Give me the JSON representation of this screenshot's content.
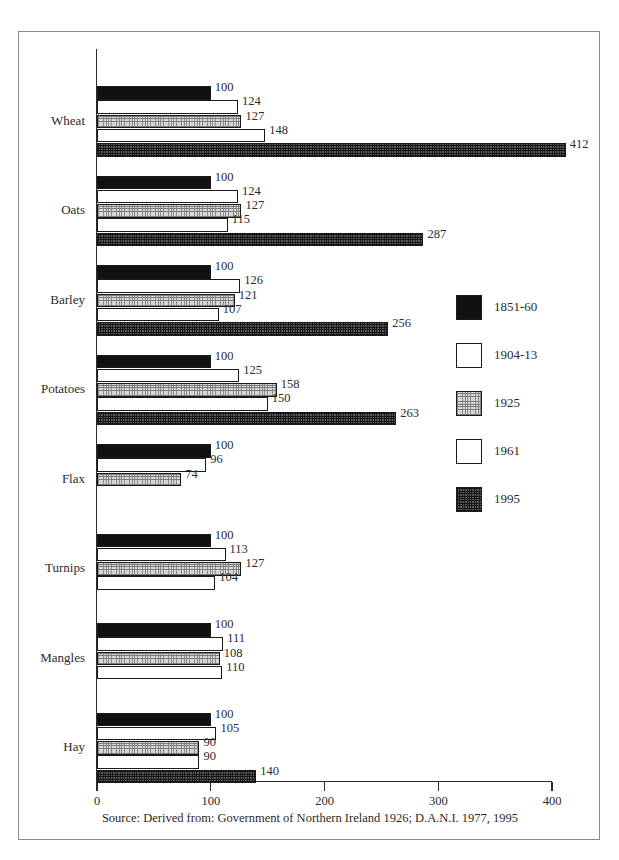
{
  "chart_data": {
    "type": "bar",
    "orientation": "horizontal",
    "title": "",
    "subtitle": "",
    "xlabel": "",
    "ylabel": "",
    "xlim": [
      0,
      400
    ],
    "xticks": [
      0,
      100,
      200,
      300,
      400
    ],
    "xtick_labels": [
      "0",
      "100",
      "200",
      "300",
      "400"
    ],
    "grid": false,
    "legend_position": "right-middle",
    "categories": [
      "Wheat",
      "Oats",
      "Barley",
      "Potatoes",
      "Flax",
      "Turnips",
      "Mangles",
      "Hay"
    ],
    "series": [
      {
        "name": "1851-60",
        "fill": "solid-black",
        "color": "#111111",
        "values": [
          100,
          100,
          100,
          100,
          100,
          100,
          100,
          100
        ]
      },
      {
        "name": "1904-13",
        "fill": "white",
        "color": "#ffffff",
        "values": [
          124,
          124,
          126,
          125,
          96,
          113,
          111,
          105
        ]
      },
      {
        "name": "1925",
        "fill": "light-grid-hatch",
        "color": "#d6d6d6",
        "values": [
          127,
          127,
          121,
          158,
          74,
          127,
          108,
          90
        ]
      },
      {
        "name": "1961",
        "fill": "white",
        "color": "#ffffff",
        "values": [
          148,
          115,
          107,
          150,
          null,
          104,
          110,
          90
        ]
      },
      {
        "name": "1995",
        "fill": "dark-grid-hatch",
        "color": "#585858",
        "values": [
          412,
          287,
          256,
          263,
          null,
          null,
          null,
          140
        ]
      }
    ],
    "data_labels": {
      "Wheat": [
        "100",
        "124",
        "127",
        "148",
        "412"
      ],
      "Oats": [
        "100",
        "124",
        "127",
        "115",
        "287"
      ],
      "Barley": [
        "100",
        "126",
        "121",
        "107",
        "256"
      ],
      "Potatoes": [
        "100",
        "125",
        "158",
        "150",
        "263"
      ],
      "Flax": [
        "100",
        "96",
        "74"
      ],
      "Turnips": [
        "100",
        "113",
        "127",
        "104"
      ],
      "Mangles": [
        "100",
        "111",
        "108",
        "110"
      ],
      "Hay": [
        "100",
        "105",
        "90",
        "90",
        "140"
      ]
    },
    "source_note": "Source: Derived from: Government of Northern Ireland 1926; D.A.N.I. 1977, 1995"
  },
  "legend": {
    "items": [
      {
        "label": "1851-60"
      },
      {
        "label": "1904-13"
      },
      {
        "label": "1925"
      },
      {
        "label": "1961"
      },
      {
        "label": "1995"
      }
    ]
  },
  "axis": {
    "x_tick_labels": [
      "0",
      "100",
      "200",
      "300",
      "400"
    ]
  },
  "footer": {
    "source": "Source: Derived from: Government of Northern Ireland 1926; D.A.N.I. 1977, 1995"
  }
}
